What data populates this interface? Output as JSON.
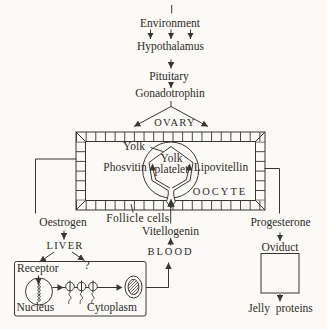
{
  "colors": {
    "ink": "#3a352f",
    "paper": "#fbfaf7"
  },
  "flow": {
    "environment": "Environment",
    "hypothalamus": "Hypothalamus",
    "pituitary": "Pituitary",
    "gonadotrophin": "Gonadotrophin",
    "ovary": "OVARY",
    "oestrogen": "Oestrogen",
    "progesterone": "Progesterone",
    "liver": "LIVER",
    "blood": "BLOOD",
    "vitellogenin": "Vitellogenin",
    "unknown_target": "?"
  },
  "ovary_box": {
    "yolk": "Yolk",
    "yolk_platelet_line1": "Yolk",
    "yolk_platelet_line2": "platelet",
    "phosvitin": "Phosvitin",
    "lipovitellin": "Lipovitellin",
    "oocyte": "OOCYTE",
    "follicle_cells": "Follicle cells"
  },
  "liver_box": {
    "receptor": "Receptor",
    "nucleus": "Nucleus",
    "cytoplasm": "Cytoplasm"
  },
  "oviduct_box": {
    "oviduct": "Oviduct",
    "jelly_proteins": "Jelly proteins"
  }
}
